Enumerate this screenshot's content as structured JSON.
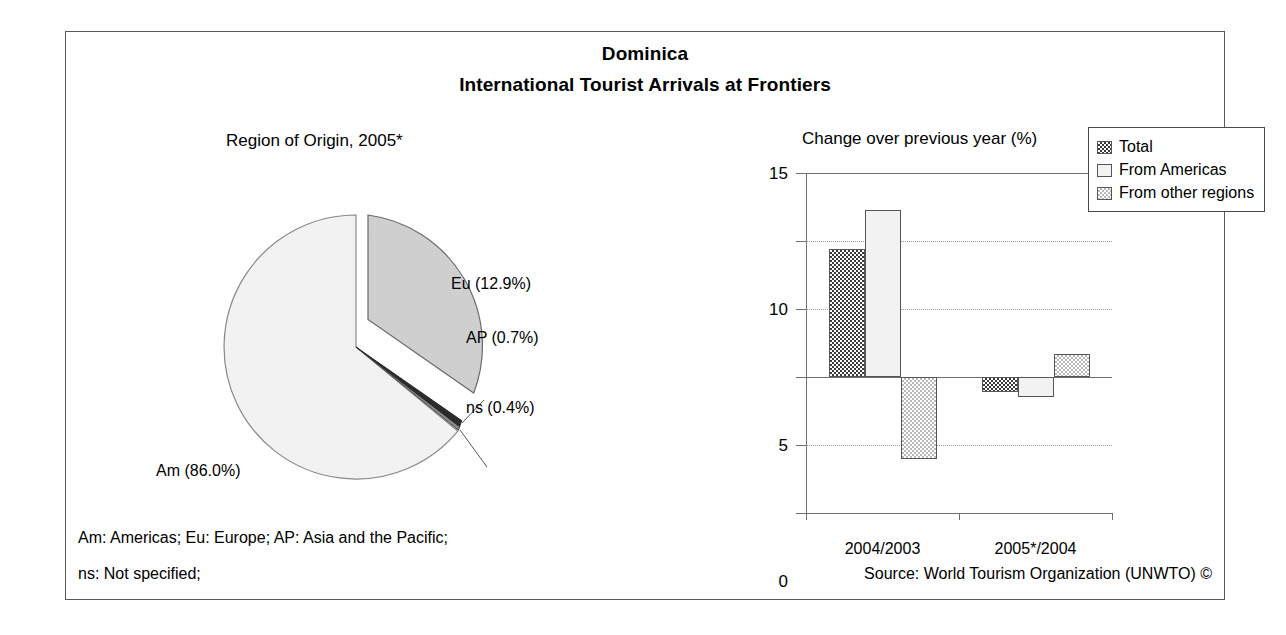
{
  "header": {
    "country": "Dominica",
    "subject": "International Tourist Arrivals at Frontiers"
  },
  "pie_panel": {
    "caption": "Region of Origin, 2005*",
    "labels": {
      "eu": "Eu (12.9%)",
      "ap": "AP (0.7%)",
      "ns": "ns (0.4%)",
      "am": "Am (86.0%)"
    }
  },
  "bar_panel": {
    "caption": "Change over previous year (%)",
    "legend": [
      {
        "label": "Total",
        "swatch": "dark-checker"
      },
      {
        "label": "From Americas",
        "swatch": "white"
      },
      {
        "label": "From other regions",
        "swatch": "light-checker"
      }
    ]
  },
  "footer": {
    "note_line1": "Am: Americas; Eu: Europe; AP: Asia and the Pacific;",
    "note_line2": "ns: Not specified;",
    "source": "Source: World Tourism Organization (UNWTO) ©"
  },
  "colors": {
    "frame": "#5a5a5a",
    "axis": "#6e6e6e",
    "grid": "#9a9a9a",
    "total_fill": "#3a3a3a",
    "americas_fill": "#f2f2f2",
    "other_fill": "#b9b9b9",
    "pie_am": "#f2f2f2",
    "pie_eu": "#cfcfcf",
    "pie_ap": "#2b2b2b",
    "pie_ns": "#8a8a8a"
  },
  "chart_data": [
    {
      "type": "pie",
      "title": "Region of Origin, 2005*",
      "unit": "%",
      "exploded_slice": "Eu",
      "start_angle_deg": 0,
      "direction": "clockwise",
      "labels": [
        "Eu",
        "AP",
        "ns",
        "Am"
      ],
      "values": [
        12.9,
        0.7,
        0.4,
        86.0
      ],
      "slices": [
        {
          "label": "Eu",
          "display": "Eu (12.9%)",
          "value": 12.9,
          "fill": "#cfcfcf",
          "exploded": true
        },
        {
          "label": "AP",
          "display": "AP (0.7%)",
          "value": 0.7,
          "fill": "#2b2b2b",
          "exploded": false
        },
        {
          "label": "ns",
          "display": "ns (0.4%)",
          "value": 0.4,
          "fill": "#8a8a8a",
          "exploded": false
        },
        {
          "label": "Am",
          "display": "Am (86.0%)",
          "value": 86.0,
          "fill": "#f2f2f2",
          "exploded": false
        }
      ]
    },
    {
      "type": "bar",
      "title": "Change over previous year (%)",
      "xlabel": "",
      "ylabel": "",
      "ylim": [
        -10,
        15
      ],
      "yticks": [
        15,
        10,
        5,
        0,
        -5,
        -10
      ],
      "ytick_labels": [
        "15",
        "10",
        "5",
        "0",
        "-5",
        "-10"
      ],
      "grid": true,
      "legend_position": "top-right",
      "categories": [
        "2004/2003",
        "2005*/2004"
      ],
      "series": [
        {
          "name": "Total",
          "values": [
            9.4,
            -1.1
          ]
        },
        {
          "name": "From Americas",
          "values": [
            12.3,
            -1.5
          ]
        },
        {
          "name": "From other regions",
          "values": [
            -6.0,
            1.7
          ]
        }
      ]
    }
  ]
}
